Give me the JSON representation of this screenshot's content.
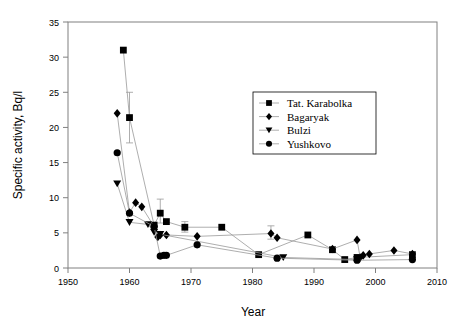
{
  "chart_data": {
    "type": "scatter",
    "title": "",
    "xlabel": "Year",
    "ylabel": "Specific activity, Bq/l",
    "xlim": [
      1950,
      2010
    ],
    "ylim": [
      0,
      35
    ],
    "xticks": [
      1950,
      1960,
      1970,
      1980,
      1990,
      2000,
      2010
    ],
    "yticks": [
      0,
      5,
      10,
      15,
      20,
      25,
      30,
      35
    ],
    "grid": false,
    "legend_position": "upper-right",
    "connected": true,
    "series": [
      {
        "name": "Tat. Karabolka",
        "marker": "square",
        "color": "#000000",
        "points": [
          {
            "x": 1959,
            "y": 31.0
          },
          {
            "x": 1960,
            "y": 21.4,
            "yerr_low": 17.8,
            "yerr_high": 25.0
          },
          {
            "x": 1964,
            "y": 6.1
          },
          {
            "x": 1965,
            "y": 7.8,
            "yerr_low": 6.4,
            "yerr_high": 9.8
          },
          {
            "x": 1966,
            "y": 6.6
          },
          {
            "x": 1969,
            "y": 5.8,
            "yerr_low": 5.1,
            "yerr_high": 6.6
          },
          {
            "x": 1975,
            "y": 5.8
          },
          {
            "x": 1981,
            "y": 1.9
          },
          {
            "x": 1989,
            "y": 4.7
          },
          {
            "x": 1993,
            "y": 2.6
          },
          {
            "x": 1995,
            "y": 1.2
          },
          {
            "x": 1997,
            "y": 1.5
          },
          {
            "x": 2006,
            "y": 1.9
          }
        ]
      },
      {
        "name": "Bagaryak",
        "marker": "diamond",
        "color": "#000000",
        "points": [
          {
            "x": 1958,
            "y": 22.0
          },
          {
            "x": 1960,
            "y": 7.9
          },
          {
            "x": 1961,
            "y": 9.3
          },
          {
            "x": 1962,
            "y": 8.7
          },
          {
            "x": 1964,
            "y": 5.9
          },
          {
            "x": 1964.6,
            "y": 4.4
          },
          {
            "x": 1965,
            "y": 4.7
          },
          {
            "x": 1966,
            "y": 4.7
          },
          {
            "x": 1971,
            "y": 4.5
          },
          {
            "x": 1983,
            "y": 4.9,
            "yerr_low": 4.1,
            "yerr_high": 6.0
          },
          {
            "x": 1984,
            "y": 4.3
          },
          {
            "x": 1993,
            "y": 2.7
          },
          {
            "x": 1997,
            "y": 4.0
          },
          {
            "x": 1997.5,
            "y": 1.5
          },
          {
            "x": 1998,
            "y": 1.8
          },
          {
            "x": 1999,
            "y": 2.0
          },
          {
            "x": 2003,
            "y": 2.5
          },
          {
            "x": 2006,
            "y": 2.0
          }
        ]
      },
      {
        "name": "Bulzi",
        "marker": "triangle-down",
        "color": "#000000",
        "points": [
          {
            "x": 1958,
            "y": 12.0
          },
          {
            "x": 1960,
            "y": 6.5
          },
          {
            "x": 1963,
            "y": 6.2
          },
          {
            "x": 1964,
            "y": 5.1
          },
          {
            "x": 1965,
            "y": 4.8
          },
          {
            "x": 1985,
            "y": 1.5
          },
          {
            "x": 1997,
            "y": 1.2
          }
        ]
      },
      {
        "name": "Yushkovo",
        "marker": "circle",
        "color": "#000000",
        "points": [
          {
            "x": 1958,
            "y": 16.4
          },
          {
            "x": 1960,
            "y": 7.8
          },
          {
            "x": 1964,
            "y": 5.9
          },
          {
            "x": 1965,
            "y": 1.7
          },
          {
            "x": 1965.6,
            "y": 1.8
          },
          {
            "x": 1966,
            "y": 1.8
          },
          {
            "x": 1971,
            "y": 3.3
          },
          {
            "x": 1984,
            "y": 1.4
          },
          {
            "x": 1997,
            "y": 1.1
          },
          {
            "x": 2006,
            "y": 1.2
          }
        ]
      }
    ]
  },
  "legend": {
    "entries": [
      {
        "label": "Tat. Karabolka"
      },
      {
        "label": "Bagaryak"
      },
      {
        "label": "Bulzi"
      },
      {
        "label": "Yushkovo"
      }
    ]
  },
  "axes": {
    "x_title": "Year",
    "y_title": "Specific activity, Bq/l",
    "x_tick_labels": [
      "1950",
      "1960",
      "1970",
      "1980",
      "1990",
      "2000",
      "2010"
    ],
    "y_tick_labels": [
      "0",
      "5",
      "10",
      "15",
      "20",
      "25",
      "30",
      "35"
    ]
  },
  "colors": {
    "frame": "#808080",
    "line": "#999999",
    "marker": "#000000",
    "text": "#000000",
    "background": "#ffffff"
  }
}
